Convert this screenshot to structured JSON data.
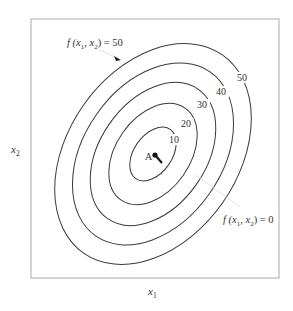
{
  "diagram": {
    "type": "contour_plot",
    "frame": {
      "x": 31,
      "y": 19,
      "width": 248,
      "height": 259,
      "stroke": "#bdbdbd"
    },
    "axes": {
      "x_label": {
        "base": "x",
        "sub": "1"
      },
      "y_label": {
        "base": "x",
        "sub": "2"
      }
    },
    "center": {
      "x": 153,
      "y": 154
    },
    "rotation_deg": -55,
    "contours": [
      {
        "level": "10",
        "rx": 30,
        "ry": 19,
        "label_x": 169,
        "label_y": 143
      },
      {
        "level": "20",
        "rx": 56,
        "ry": 37,
        "label_x": 181,
        "label_y": 127
      },
      {
        "level": "30",
        "rx": 79,
        "ry": 53,
        "label_x": 197,
        "label_y": 108
      },
      {
        "level": "40",
        "rx": 100,
        "ry": 69,
        "label_x": 216,
        "label_y": 95
      },
      {
        "level": "50",
        "rx": 121,
        "ry": 85,
        "label_x": 237,
        "label_y": 81
      }
    ],
    "point_A": {
      "label": "A",
      "x": 155,
      "y": 155,
      "arrow_to_x": 162,
      "arrow_to_y": 163
    },
    "annotations": {
      "top": {
        "text_prefix": "f (",
        "x1": "x",
        "s1": "1",
        "sep": ", ",
        "x2": "x",
        "s2": "2",
        "text_suffix": ") = 50"
      },
      "bottom": {
        "text_prefix": "f (",
        "x1": "x",
        "s1": "1",
        "sep": ", ",
        "x2": "x",
        "s2": "2",
        "text_suffix": ") = 0"
      }
    },
    "colors": {
      "curve": "#3a3a3a",
      "frame": "#bdbdbd",
      "text": "#333333",
      "leader": "#d8d8d8"
    }
  }
}
